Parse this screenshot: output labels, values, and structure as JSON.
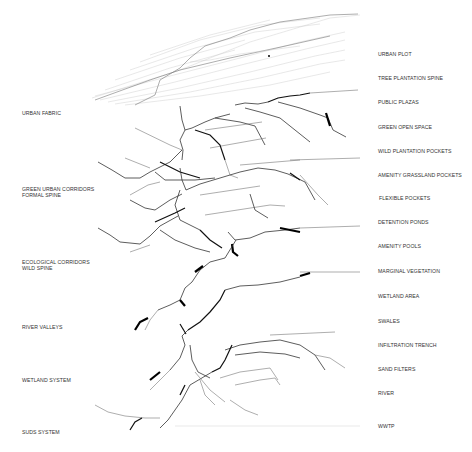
{
  "diagram": {
    "type": "exploded-axonometric-layers",
    "left_labels": [
      {
        "text": "URBAN FABRIC",
        "x": 22,
        "y": 113
      },
      {
        "text": "GREEN URBAN CORRIDORS",
        "x": 22,
        "y": 189
      },
      {
        "text": "FORMAL SPINE",
        "x": 22,
        "y": 195
      },
      {
        "text": "ECOLOGICAL CORRIDORS",
        "x": 22,
        "y": 262
      },
      {
        "text": "WILD SPINE",
        "x": 22,
        "y": 268
      },
      {
        "text": "RIVER VALLEYS",
        "x": 22,
        "y": 327
      },
      {
        "text": "WETLAND SYSTEM",
        "x": 22,
        "y": 380
      },
      {
        "text": "SUDS SYSTEM",
        "x": 22,
        "y": 432
      }
    ],
    "right_labels": [
      {
        "text": "URBAN PLOT",
        "x": 378,
        "y": 54
      },
      {
        "text": "TREE PLANTATION SPINE",
        "x": 378,
        "y": 78
      },
      {
        "text": "PUBLIC PLAZAS",
        "x": 378,
        "y": 102
      },
      {
        "text": "GREEN  OPEN SPACE",
        "x": 378,
        "y": 127
      },
      {
        "text": "WILD PLANTATION POCKETS",
        "x": 378,
        "y": 151
      },
      {
        "text": "AMENITY GRASSLAND POCKETS",
        "x": 378,
        "y": 175
      },
      {
        "text": "FLEXIBLE POCKETS",
        "x": 379,
        "y": 198
      },
      {
        "text": "DETENTION PONDS",
        "x": 378,
        "y": 222
      },
      {
        "text": "AMENITY POOLS",
        "x": 378,
        "y": 246
      },
      {
        "text": "MARGINAL VEGETATION",
        "x": 378,
        "y": 271
      },
      {
        "text": "WETLAND AREA",
        "x": 378,
        "y": 296
      },
      {
        "text": "SWALES",
        "x": 378,
        "y": 321
      },
      {
        "text": "INFILTRATION TRENCH",
        "x": 378,
        "y": 345
      },
      {
        "text": "SAND FILTERS",
        "x": 378,
        "y": 369
      },
      {
        "text": "RIVER",
        "x": 378,
        "y": 393
      },
      {
        "text": "WWTP",
        "x": 378,
        "y": 426
      }
    ],
    "colors": {
      "background": "#ffffff",
      "linework": "#111111",
      "text": "#333333",
      "faint": "#c4c4c4"
    }
  }
}
